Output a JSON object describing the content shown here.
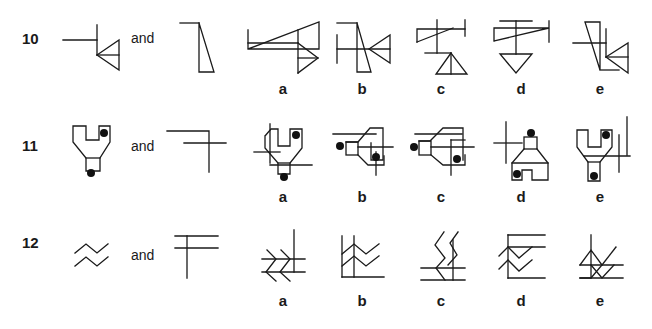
{
  "questions": [
    {
      "number": "10",
      "connector": "and",
      "options": [
        "a",
        "b",
        "c",
        "d",
        "e"
      ]
    },
    {
      "number": "11",
      "connector": "and",
      "options": [
        "a",
        "b",
        "c",
        "d",
        "e"
      ]
    },
    {
      "number": "12",
      "connector": "and",
      "options": [
        "a",
        "b",
        "c",
        "d",
        "e"
      ]
    }
  ],
  "colors": {
    "ink": "#1a1a1a",
    "background": "#ffffff"
  }
}
